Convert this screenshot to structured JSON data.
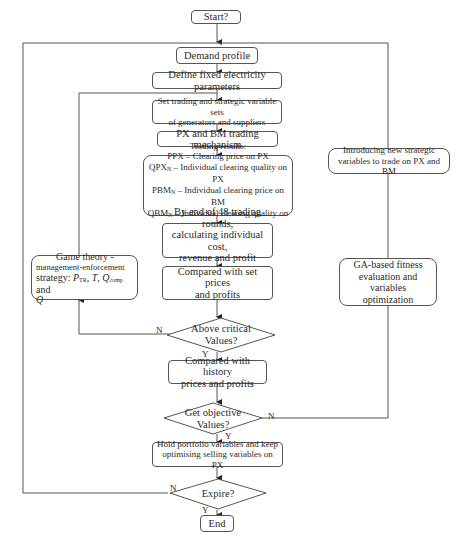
{
  "flowchart": {
    "nodes": {
      "start": {
        "label": "Start?"
      },
      "demand_profile": {
        "label": "Demand profile"
      },
      "define_params": {
        "label": "Define fixed electricity parameters"
      },
      "set_trading": {
        "line1": "Set trading and strategic variable sets",
        "line2": "of generators and suppliers"
      },
      "px_bm": {
        "label": "PX and BM trading mechanism"
      },
      "trading_results": {
        "title": "Trading results:",
        "lines": [
          {
            "main": "PPX",
            "sub": "",
            "rest": " – Clearing price on PX"
          },
          {
            "main": "QPX",
            "sub": "N",
            "rest": " – Individual clearing quality on PX"
          },
          {
            "main": "PBM",
            "sub": "N",
            "rest": " – Individual clearing price on BM"
          },
          {
            "main": "QBM",
            "sub": "N",
            "rest": " – Individual clearing quality on BM"
          }
        ]
      },
      "end_of_rounds": {
        "line1": "By end of 48 trading rounds,",
        "line2": "calculating individual cost,",
        "line3": "revenue and profit profiles"
      },
      "compare_set": {
        "line1": "Compared with set prices",
        "line2": "and profits"
      },
      "above_critical": {
        "line1": "Above critical",
        "line2": "Values?"
      },
      "compare_history": {
        "line1": "Compared with history",
        "line2": "prices and profits"
      },
      "get_objective": {
        "line1": "Get objective",
        "line2": "Values?"
      },
      "hold_portfolio": {
        "line1": "Hold portfolio variables and keep",
        "line2": "optimising selling variables on PX"
      },
      "expire": {
        "label": "Expire?"
      },
      "end": {
        "label": "End"
      },
      "game_theory": {
        "line1": "Game theory -",
        "line2": "management-enforcement",
        "line3_prefix": "strategy: ",
        "p": "P",
        "p_sub": "TR",
        "sep1": ", ",
        "t": "T",
        "sep2": ",  ",
        "q": "Q",
        "q_sub": "comp",
        "and": " and",
        "q_last": "Q"
      },
      "introducing": {
        "line1": "Introducing new strategic",
        "line2": "variables to trade on PX and BM"
      },
      "ga_based": {
        "line1": "GA-based fitness",
        "line2": "evaluation and variables",
        "line3": "optimization"
      }
    },
    "edge_labels": {
      "above_no": "N",
      "above_yes": "Y",
      "objective_no": "N",
      "objective_yes": "Y",
      "expire_no": "N",
      "expire_yes": "Y"
    }
  }
}
